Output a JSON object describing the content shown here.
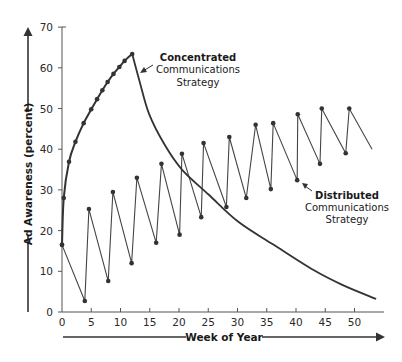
{
  "chart_data": {
    "type": "line",
    "title": "",
    "xlabel": "Week of Year",
    "ylabel": "Ad Awareness (percent)",
    "xlim": [
      0,
      55
    ],
    "ylim": [
      0,
      70
    ],
    "x_ticks": [
      0,
      5,
      10,
      15,
      20,
      25,
      30,
      35,
      40,
      45,
      50
    ],
    "y_ticks": [
      0,
      10,
      20,
      30,
      40,
      50,
      60,
      70
    ],
    "grid": false,
    "legend": "none (inline annotations)",
    "series": [
      {
        "name": "Concentrated Communications Strategy",
        "markers_rise": true,
        "points": [
          [
            0,
            16.5
          ],
          [
            0.3,
            28
          ],
          [
            1.2,
            36.9
          ],
          [
            2.3,
            41.8
          ],
          [
            3.7,
            46.4
          ],
          [
            5,
            49.8
          ],
          [
            6,
            52.3
          ],
          [
            6.9,
            54.5
          ],
          [
            7.8,
            56.5
          ],
          [
            8.8,
            58.5
          ],
          [
            9.8,
            60.2
          ],
          [
            10.7,
            61.7
          ],
          [
            12,
            63.4
          ]
        ],
        "decay": [
          [
            12,
            63.4
          ],
          [
            13.2,
            57
          ],
          [
            14.9,
            48.6
          ],
          [
            17.5,
            41.2
          ],
          [
            20.5,
            35
          ],
          [
            25.1,
            28.8
          ],
          [
            30.2,
            22.1
          ],
          [
            36.2,
            16.5
          ],
          [
            43,
            10.3
          ],
          [
            48,
            6.6
          ],
          [
            53.7,
            3.2
          ]
        ]
      },
      {
        "name": "Distributed Communications Strategy",
        "points": [
          [
            0,
            16.5
          ],
          [
            3.9,
            2.7
          ],
          [
            4.6,
            25.3
          ],
          [
            7.9,
            7.6
          ],
          [
            8.7,
            29.5
          ],
          [
            11.9,
            12
          ],
          [
            12.8,
            33
          ],
          [
            16.1,
            17
          ],
          [
            17,
            36.4
          ],
          [
            20.1,
            19
          ],
          [
            20.5,
            38.9
          ],
          [
            23.8,
            23.3
          ],
          [
            24.2,
            41.5
          ],
          [
            28.1,
            25.8
          ],
          [
            28.6,
            43
          ],
          [
            31.5,
            28
          ],
          [
            33.1,
            46
          ],
          [
            35.7,
            30.2
          ],
          [
            36.1,
            46.4
          ],
          [
            40.2,
            32.4
          ],
          [
            40.3,
            48.6
          ],
          [
            44.1,
            36.4
          ],
          [
            44.4,
            50
          ],
          [
            48.5,
            39
          ],
          [
            49.1,
            50
          ],
          [
            53,
            40
          ]
        ]
      }
    ],
    "annotations": [
      {
        "bold": "Concentrated",
        "lines": [
          "Communications",
          "Strategy"
        ],
        "pointer_to": "decay curve near week 13"
      },
      {
        "bold": "Distributed",
        "lines": [
          "Communications",
          "Strategy"
        ],
        "pointer_to": "distributed trough near week 40"
      }
    ]
  },
  "labels": {
    "ylabel": "Ad Awareness (percent)",
    "xlabel": "Week of Year",
    "concentrated_bold": "Concentrated",
    "concentrated_line1": "Communications",
    "concentrated_line2": "Strategy",
    "distributed_bold": "Distributed",
    "distributed_line1": "Communications",
    "distributed_line2": "Strategy"
  },
  "colors": {
    "ink": "#2b2b2b",
    "concentrated": "#333333",
    "distributed": "#444444",
    "background": "#ffffff"
  }
}
